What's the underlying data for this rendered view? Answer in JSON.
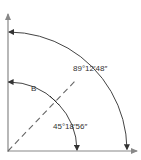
{
  "diagram": {
    "title": "",
    "labels": {
      "outer_angle": "89°12′48″",
      "angle_b": "B",
      "inner_angle": "45°18′56″"
    },
    "angles_deg": {
      "outer_arc": 89.2133,
      "dashed_line": 45.3156
    },
    "colors": {
      "line": "#555555",
      "axis": "#888888",
      "text": "#333333"
    }
  }
}
